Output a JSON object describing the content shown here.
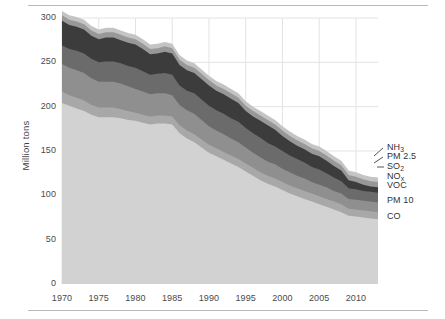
{
  "chart_data": {
    "type": "area",
    "title": "",
    "subtitle": "",
    "xlabel": "",
    "ylabel": "Million tons",
    "xlim": [
      1970,
      2013
    ],
    "ylim": [
      0,
      300
    ],
    "grid": true,
    "legend_position": "right-outside",
    "stacked": true,
    "x": [
      1970,
      1971,
      1972,
      1973,
      1974,
      1975,
      1976,
      1977,
      1978,
      1979,
      1980,
      1981,
      1982,
      1983,
      1984,
      1985,
      1986,
      1987,
      1988,
      1989,
      1990,
      1991,
      1992,
      1993,
      1994,
      1995,
      1996,
      1997,
      1998,
      1999,
      2000,
      2001,
      2002,
      2003,
      2004,
      2005,
      2006,
      2007,
      2008,
      2009,
      2010,
      2011,
      2012,
      2013
    ],
    "xticks": [
      1970,
      1975,
      1980,
      1985,
      1990,
      1995,
      2000,
      2005,
      2010
    ],
    "yticks": [
      0,
      50,
      100,
      150,
      200,
      250,
      300
    ],
    "series": [
      {
        "name": "CO",
        "color": "#d2d2d2",
        "values": [
          204,
          201,
          198,
          195,
          191,
          188,
          188,
          188,
          187,
          185,
          184,
          182,
          180,
          181,
          181,
          180,
          170,
          164,
          160,
          154,
          148,
          144,
          140,
          136,
          132,
          127,
          122,
          117,
          113,
          110,
          106,
          102,
          99,
          96,
          93,
          90,
          87,
          84,
          81,
          77,
          76,
          75,
          74,
          73
        ]
      },
      {
        "name": "PM 10",
        "color": "#a8a8a8",
        "values": [
          13,
          12,
          12,
          12,
          11,
          11,
          11,
          11,
          10,
          10,
          9,
          9,
          9,
          9,
          9,
          9,
          9,
          9,
          9,
          9,
          9,
          9,
          9,
          9,
          9,
          9,
          9,
          9,
          9,
          9,
          9,
          9,
          9,
          9,
          9,
          9,
          9,
          9,
          9,
          8,
          8,
          8,
          8,
          8
        ]
      },
      {
        "name": "VOC",
        "color": "#8f8f8f",
        "values": [
          31,
          31,
          31,
          31,
          30,
          29,
          29,
          29,
          29,
          28,
          27,
          26,
          25,
          25,
          25,
          24,
          23,
          23,
          23,
          22,
          21,
          20,
          20,
          19,
          19,
          18,
          17,
          17,
          16,
          16,
          15,
          15,
          14,
          14,
          13,
          13,
          13,
          12,
          12,
          11,
          11,
          11,
          11,
          11
        ]
      },
      {
        "name": "NO<sub>x</sub>",
        "color": "#6b6b6b",
        "values": [
          21,
          21,
          22,
          22,
          22,
          22,
          23,
          23,
          23,
          23,
          24,
          23,
          22,
          22,
          23,
          23,
          22,
          22,
          23,
          23,
          23,
          23,
          23,
          23,
          23,
          22,
          22,
          22,
          21,
          20,
          20,
          19,
          19,
          18,
          17,
          17,
          16,
          15,
          14,
          12,
          12,
          11,
          11,
          11
        ]
      },
      {
        "name": "SO<sub>2</sub>",
        "color": "#3c3c3c",
        "values": [
          28,
          27,
          27,
          27,
          26,
          26,
          27,
          27,
          26,
          26,
          26,
          25,
          23,
          23,
          24,
          24,
          23,
          23,
          23,
          23,
          23,
          22,
          22,
          22,
          21,
          19,
          19,
          19,
          20,
          19,
          17,
          16,
          15,
          15,
          15,
          15,
          14,
          13,
          12,
          9,
          8,
          7,
          6,
          6
        ]
      },
      {
        "name": "PM 2.5",
        "color": "#989898",
        "values": [
          6,
          6,
          6,
          6,
          6,
          6,
          6,
          6,
          6,
          6,
          6,
          6,
          6,
          6,
          6,
          6,
          6,
          6,
          6,
          6,
          6,
          6,
          6,
          6,
          6,
          6,
          6,
          6,
          6,
          6,
          6,
          6,
          6,
          6,
          6,
          6,
          6,
          6,
          6,
          6,
          6,
          6,
          6,
          6
        ]
      },
      {
        "name": "NH<sub>3</sub>",
        "color": "#c4c4c4",
        "values": [
          5,
          5,
          5,
          5,
          5,
          5,
          5,
          5,
          5,
          5,
          5,
          5,
          5,
          5,
          5,
          5,
          5,
          5,
          5,
          5,
          5,
          5,
          5,
          5,
          5,
          5,
          5,
          5,
          5,
          5,
          5,
          5,
          5,
          5,
          5,
          5,
          5,
          5,
          5,
          5,
          5,
          5,
          5,
          5
        ]
      }
    ]
  },
  "axes": {
    "ylabel": "Million tons",
    "yticks": [
      "300",
      "250",
      "200",
      "150",
      "100",
      "50",
      "0"
    ],
    "xticks": [
      "1970",
      "1975",
      "1980",
      "1985",
      "1990",
      "1995",
      "2000",
      "2005",
      "2010"
    ]
  },
  "legend": {
    "items": [
      {
        "label_html": "NH<sub>3</sub>",
        "label": "NH3"
      },
      {
        "label_html": "PM 2.5",
        "label": "PM 2.5"
      },
      {
        "label_html": "SO<sub>2</sub>",
        "label": "SO2"
      },
      {
        "label_html": "NO<sub>x</sub>",
        "label": "NOx"
      },
      {
        "label_html": "VOC",
        "label": "VOC"
      },
      {
        "label_html": "PM 10",
        "label": "PM 10"
      },
      {
        "label_html": "CO",
        "label": "CO"
      }
    ]
  },
  "style": {
    "background": "#ffffff",
    "grid_color": "#e3e3e3",
    "rule_color": "#b9b9b9",
    "text_color": "#3a3a3a"
  }
}
